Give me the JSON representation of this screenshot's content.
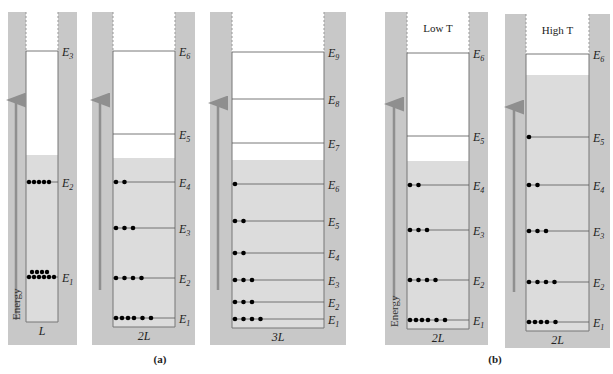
{
  "figure": {
    "panel_labels": [
      "(a)",
      "(b)"
    ],
    "axis_label": "Energy",
    "colors": {
      "wall": "#c8c8c8",
      "fill": "#dcdcdc",
      "arrow": "#8f8f8f",
      "line": "#555555",
      "electron": "#000000"
    }
  },
  "wells": [
    {
      "id": "well-L",
      "width_label": "L",
      "top_label": "",
      "group": "a",
      "levels": [
        {
          "n": 1,
          "label": "E",
          "sub": "1",
          "electrons": 10
        },
        {
          "n": 2,
          "label": "E",
          "sub": "2",
          "electrons": 5
        },
        {
          "n": 3,
          "label": "E",
          "sub": "3",
          "electrons": 0
        }
      ],
      "fermi_between": [
        2,
        3
      ]
    },
    {
      "id": "well-2L",
      "width_label": "2L",
      "top_label": "",
      "group": "a",
      "levels": [
        {
          "n": 1,
          "label": "E",
          "sub": "1",
          "electrons": 6
        },
        {
          "n": 2,
          "label": "E",
          "sub": "2",
          "electrons": 4
        },
        {
          "n": 3,
          "label": "E",
          "sub": "3",
          "electrons": 3
        },
        {
          "n": 4,
          "label": "E",
          "sub": "4",
          "electrons": 2
        },
        {
          "n": 5,
          "label": "E",
          "sub": "5",
          "electrons": 0
        },
        {
          "n": 6,
          "label": "E",
          "sub": "6",
          "electrons": 0
        }
      ],
      "fermi_between": [
        4,
        5
      ]
    },
    {
      "id": "well-3L",
      "width_label": "3L",
      "top_label": "",
      "group": "a",
      "levels": [
        {
          "n": 1,
          "label": "E",
          "sub": "1",
          "electrons": 4
        },
        {
          "n": 2,
          "label": "E",
          "sub": "2",
          "electrons": 3
        },
        {
          "n": 3,
          "label": "E",
          "sub": "3",
          "electrons": 3
        },
        {
          "n": 4,
          "label": "E",
          "sub": "4",
          "electrons": 2
        },
        {
          "n": 5,
          "label": "E",
          "sub": "5",
          "electrons": 2
        },
        {
          "n": 6,
          "label": "E",
          "sub": "6",
          "electrons": 1
        },
        {
          "n": 7,
          "label": "E",
          "sub": "7",
          "electrons": 0
        },
        {
          "n": 8,
          "label": "E",
          "sub": "8",
          "electrons": 0
        },
        {
          "n": 9,
          "label": "E",
          "sub": "9",
          "electrons": 0
        }
      ],
      "fermi_between": [
        6,
        7
      ]
    },
    {
      "id": "well-2L-lowT",
      "width_label": "2L",
      "top_label": "Low T",
      "group": "b",
      "levels": [
        {
          "n": 1,
          "label": "E",
          "sub": "1",
          "electrons": 6
        },
        {
          "n": 2,
          "label": "E",
          "sub": "2",
          "electrons": 4
        },
        {
          "n": 3,
          "label": "E",
          "sub": "3",
          "electrons": 3
        },
        {
          "n": 4,
          "label": "E",
          "sub": "4",
          "electrons": 2
        },
        {
          "n": 5,
          "label": "E",
          "sub": "5",
          "electrons": 0
        },
        {
          "n": 6,
          "label": "E",
          "sub": "6",
          "electrons": 0
        }
      ],
      "fermi_between": [
        4,
        5
      ]
    },
    {
      "id": "well-2L-highT",
      "width_label": "2L",
      "top_label": "High T",
      "group": "b",
      "levels": [
        {
          "n": 1,
          "label": "E",
          "sub": "1",
          "electrons": 5
        },
        {
          "n": 2,
          "label": "E",
          "sub": "2",
          "electrons": 4
        },
        {
          "n": 3,
          "label": "E",
          "sub": "3",
          "electrons": 3
        },
        {
          "n": 4,
          "label": "E",
          "sub": "4",
          "electrons": 2
        },
        {
          "n": 5,
          "label": "E",
          "sub": "5",
          "electrons": 1
        },
        {
          "n": 6,
          "label": "E",
          "sub": "6",
          "electrons": 0
        }
      ],
      "fermi_between": [
        5,
        6
      ]
    }
  ]
}
